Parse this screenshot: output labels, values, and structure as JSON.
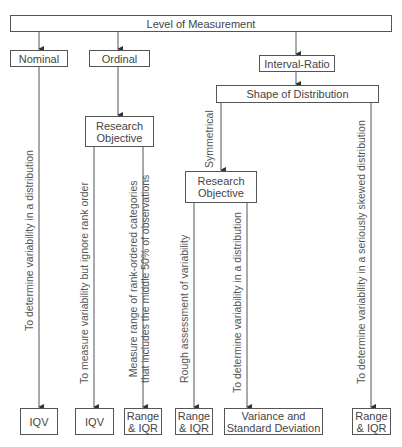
{
  "diagram": {
    "root": {
      "label": "Level of Measurement"
    },
    "levels": [
      {
        "id": "nominal",
        "label": "Nominal"
      },
      {
        "id": "ordinal",
        "label": "Ordinal"
      },
      {
        "id": "interval_ratio",
        "label": "Interval-Ratio"
      }
    ],
    "ordinal_objective": {
      "label_line1": "Research",
      "label_line2": "Objective"
    },
    "shape": {
      "label": "Shape of Distribution"
    },
    "symmetrical_label": "Symmetrical",
    "interval_objective": {
      "label_line1": "Research",
      "label_line2": "Objective"
    },
    "edges": {
      "nominal": "To determine variability in a distribution",
      "ordinal_ignore": "To measure variability but ignore rank order",
      "ordinal_range_line1": "Measure range of rank-ordered categories",
      "ordinal_range_line2": "that includes the middle 50% of observations",
      "rough": "Rough assessment of variability",
      "determine": "To determine variability in a distribution",
      "skewed": "To determine variability in a seriously skewed distribution"
    },
    "outcomes": [
      {
        "id": "nominal_iqv",
        "line1": "IQV",
        "line2": ""
      },
      {
        "id": "ordinal_iqv",
        "line1": "IQV",
        "line2": ""
      },
      {
        "id": "ordinal_range",
        "line1": "Range",
        "line2": "& IQR"
      },
      {
        "id": "sym_range",
        "line1": "Range",
        "line2": "& IQR"
      },
      {
        "id": "variance",
        "line1": "Variance and",
        "line2": "Standard Deviation"
      },
      {
        "id": "skew_range",
        "line1": "Range",
        "line2": "& IQR"
      }
    ]
  }
}
